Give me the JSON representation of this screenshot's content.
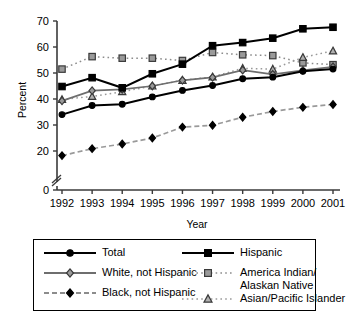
{
  "chart_data": {
    "type": "line",
    "title": "",
    "xlabel": "Year",
    "ylabel": "Percent",
    "categories": [
      1992,
      1993,
      1994,
      1995,
      1996,
      1997,
      1998,
      1999,
      2000,
      2001
    ],
    "x_tick_labels": [
      "1992",
      "1993",
      "1994",
      "1995",
      "1996",
      "1997",
      "1998",
      "1999",
      "2000",
      "2001"
    ],
    "y_tick_labels": [
      "0",
      "20",
      "30",
      "40",
      "50",
      "60",
      "70"
    ],
    "y_tick_values": [
      0,
      20,
      30,
      40,
      50,
      60,
      70
    ],
    "ylim": [
      0,
      70
    ],
    "axis_break": true,
    "grid": false,
    "legend_position": "below",
    "series": [
      {
        "name": "Total",
        "marker": "circle",
        "line_style": "solid",
        "color": "#000000",
        "marker_fill": "#000000",
        "values": [
          34,
          37.5,
          38,
          40.8,
          43.3,
          45.2,
          47.8,
          48.4,
          50.7,
          51.5
        ]
      },
      {
        "name": "White, not Hispanic",
        "marker": "diamond",
        "line_style": "solid",
        "color": "#6e6e6e",
        "marker_fill": "#9a9a9a",
        "values": [
          39.3,
          43.2,
          43.7,
          45,
          47.2,
          48.3,
          51.1,
          49.5,
          51,
          52.4
        ]
      },
      {
        "name": "Black, not Hispanic",
        "marker": "diamond",
        "line_style": "dashed",
        "color": "#9a9a9a",
        "marker_fill": "#000000",
        "values": [
          15.4,
          20.9,
          22.7,
          25,
          29.2,
          29.9,
          33,
          35.2,
          36.8,
          37.9
        ]
      },
      {
        "name": "Hispanic",
        "marker": "square",
        "line_style": "solid",
        "color": "#000000",
        "marker_fill": "#000000",
        "values": [
          44.8,
          48.2,
          44.3,
          49.7,
          53.4,
          60.5,
          61.7,
          63.4,
          67,
          67.6
        ]
      },
      {
        "name": "America Indian/ Alaskan Native",
        "marker": "square",
        "line_style": "dotted",
        "color": "#8c8c8c",
        "marker_fill": "#9a9a9a",
        "values": [
          51.5,
          56.3,
          55.7,
          55.7,
          54.8,
          57.9,
          57,
          56.7,
          53.9,
          53.2
        ]
      },
      {
        "name": "Asian/Pacific Islander",
        "marker": "triangle",
        "line_style": "dotted",
        "color": "#9a9a9a",
        "marker_fill": "#b0b0b0",
        "values": [
          39.8,
          41,
          42.8,
          45,
          47.2,
          48.5,
          51.8,
          51.5,
          56,
          58.5
        ]
      }
    ]
  },
  "legend": {
    "entries": [
      {
        "label": "Total",
        "marker": "circle",
        "line_style": "solid",
        "color": "#000000",
        "marker_fill": "#000000"
      },
      {
        "label": "White, not Hispanic",
        "marker": "diamond",
        "line_style": "solid",
        "color": "#6e6e6e",
        "marker_fill": "#9a9a9a"
      },
      {
        "label": "Black, not Hispanic",
        "marker": "diamond",
        "line_style": "dashed",
        "color": "#8c8c8c",
        "marker_fill": "#000000"
      },
      {
        "label": "Hispanic",
        "marker": "square",
        "line_style": "solid",
        "color": "#000000",
        "marker_fill": "#000000"
      },
      {
        "label": "America Indian/",
        "label2": "Alaskan Native",
        "marker": "square",
        "line_style": "dotted",
        "color": "#8c8c8c",
        "marker_fill": "#9a9a9a"
      },
      {
        "label": "Asian/Pacific Islander",
        "marker": "triangle",
        "line_style": "dotted",
        "color": "#9a9a9a",
        "marker_fill": "#b0b0b0"
      }
    ]
  }
}
